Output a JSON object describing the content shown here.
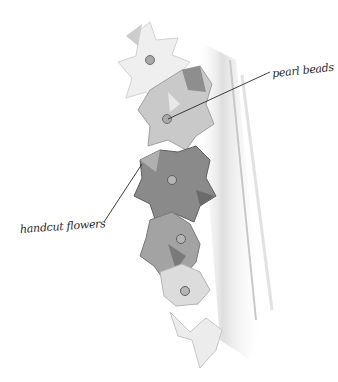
{
  "illustration": {
    "subject": "pencil sketch of a garment edge trimmed with handcut flowers and pearl beads",
    "palette": {
      "background": "#ffffff",
      "light_petal": "#e6e6e6",
      "mid_petal": "#b8b8b8",
      "dark_petal": "#7d7d7d",
      "garment_edge": "#cfcfcf",
      "line": "#2a2a2a",
      "pearl": "#9a9a9a"
    }
  },
  "annotations": {
    "pearl_beads": "pearl beads",
    "handcut_flowers": "handcut flowers"
  }
}
